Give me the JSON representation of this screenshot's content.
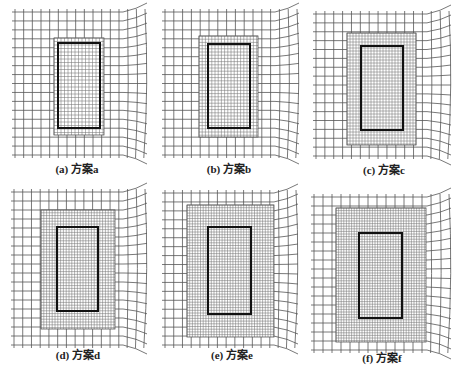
{
  "figure": {
    "background": "#ffffff",
    "line_color": "#555555",
    "fine_line_color": "#777777",
    "rect_color": "#111111",
    "panels": [
      {
        "id": "a",
        "caption": "(a) 方案a",
        "caption_x": 77,
        "caption_y": 160,
        "coarse": {
          "x0": 15,
          "y0": 12,
          "x1": 145,
          "y1": 155,
          "nx": 15,
          "ny": 16
        },
        "refined": {
          "x0": 54,
          "y0": 38,
          "x1": 104,
          "y1": 135,
          "step": 3.5
        },
        "rect": {
          "x0": 58,
          "y0": 43,
          "x1": 100,
          "y1": 128
        }
      },
      {
        "id": "b",
        "caption": "(b) 方案b",
        "caption_x": 229,
        "caption_y": 160,
        "coarse": {
          "x0": 165,
          "y0": 12,
          "x1": 297,
          "y1": 155,
          "nx": 15,
          "ny": 16
        },
        "refined": {
          "x0": 199,
          "y0": 36,
          "x1": 258,
          "y1": 137,
          "step": 3.2
        },
        "rect": {
          "x0": 208,
          "y0": 44,
          "x1": 250,
          "y1": 128
        }
      },
      {
        "id": "c",
        "caption": "(c) 方案c",
        "caption_x": 384,
        "caption_y": 161,
        "coarse": {
          "x0": 316,
          "y0": 14,
          "x1": 449,
          "y1": 156,
          "nx": 15,
          "ny": 16
        },
        "refined": {
          "x0": 347,
          "y0": 33,
          "x1": 416,
          "y1": 145,
          "step": 3.0
        },
        "rect": {
          "x0": 361,
          "y0": 46,
          "x1": 403,
          "y1": 130
        }
      },
      {
        "id": "d",
        "caption": "(d) 方案d",
        "caption_x": 78,
        "caption_y": 346,
        "coarse": {
          "x0": 14,
          "y0": 192,
          "x1": 145,
          "y1": 345,
          "nx": 15,
          "ny": 17
        },
        "refined": {
          "x0": 41,
          "y0": 210,
          "x1": 115,
          "y1": 329,
          "step": 2.8
        },
        "rect": {
          "x0": 57,
          "y0": 227,
          "x1": 98,
          "y1": 311
        }
      },
      {
        "id": "e",
        "caption": "(e) 方案e",
        "caption_x": 232,
        "caption_y": 346,
        "coarse": {
          "x0": 165,
          "y0": 193,
          "x1": 296,
          "y1": 345,
          "nx": 15,
          "ny": 17
        },
        "refined": {
          "x0": 187,
          "y0": 205,
          "x1": 274,
          "y1": 337,
          "step": 2.7
        },
        "rect": {
          "x0": 208,
          "y0": 227,
          "x1": 251,
          "y1": 314
        }
      },
      {
        "id": "f",
        "caption": "(f) 方案f",
        "caption_x": 382,
        "caption_y": 349,
        "coarse": {
          "x0": 314,
          "y0": 197,
          "x1": 449,
          "y1": 350,
          "nx": 15,
          "ny": 17
        },
        "refined": {
          "x0": 336,
          "y0": 208,
          "x1": 426,
          "y1": 342,
          "step": 2.6
        },
        "rect": {
          "x0": 359,
          "y0": 233,
          "x1": 402,
          "y1": 318
        }
      }
    ]
  }
}
